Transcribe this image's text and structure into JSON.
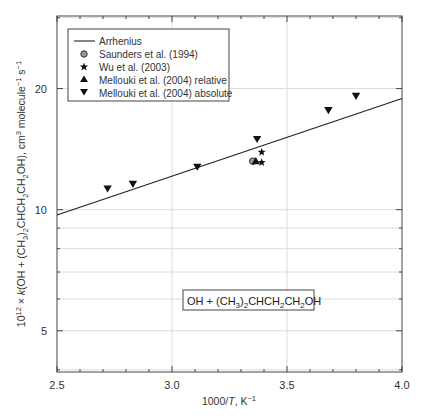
{
  "chart_data": {
    "type": "scatter",
    "title": "",
    "xlabel": "1000/T, K⁻¹",
    "ylabel": "10¹² × k(OH + (CH3)2CHCH2CH2OH), cm³ molecule⁻¹ s⁻¹",
    "xlim": [
      2.5,
      4.0
    ],
    "ylim": [
      3.95,
      30.3
    ],
    "yscale": "log",
    "grid": true,
    "x_ticks": [
      2.5,
      3.0,
      3.5,
      4.0
    ],
    "x_tick_labels": [
      "2.5",
      "3.0",
      "3.5",
      "4.0"
    ],
    "y_ticks": [
      5,
      10,
      20
    ],
    "y_tick_labels": [
      "5",
      "10",
      "20"
    ],
    "legend_position": "upper left",
    "annotation": "OH + (CH3)2CHCH2CH2OH",
    "series": [
      {
        "name": "Arrhenius",
        "kind": "line",
        "x": [
          2.5,
          4.0
        ],
        "y": [
          9.7,
          18.9
        ]
      },
      {
        "name": "Saunders et al. (1994)",
        "kind": "scatter",
        "marker": "circle",
        "x": [
          3.36
        ],
        "y": [
          13.2
        ]
      },
      {
        "name": "Wu et al. (2003)",
        "kind": "scatter",
        "marker": "star",
        "x": [
          3.39,
          3.39
        ],
        "y": [
          13.9,
          13.1
        ]
      },
      {
        "name": "Mellouki et al. (2004) relative",
        "kind": "scatter",
        "marker": "triangle-up",
        "x": [
          3.36
        ],
        "y": [
          13.2
        ]
      },
      {
        "name": "Mellouki et al. (2004) absolute",
        "kind": "scatter",
        "marker": "triangle-down",
        "x": [
          2.72,
          2.83,
          3.11,
          3.37,
          3.68,
          3.8
        ],
        "y": [
          11.3,
          11.6,
          12.8,
          15.0,
          17.7,
          19.2
        ]
      }
    ]
  },
  "labels": {
    "xlabel_main": "1000/",
    "xlabel_T": "T",
    "xlabel_unit": ", K",
    "xlabel_sup": "−1",
    "legend": [
      "Arrhenius",
      "Saunders et al. (1994)",
      "Wu et al. (2003)",
      "Mellouki et al. (2004) relative",
      "Mellouki et al. (2004) absolute"
    ]
  }
}
